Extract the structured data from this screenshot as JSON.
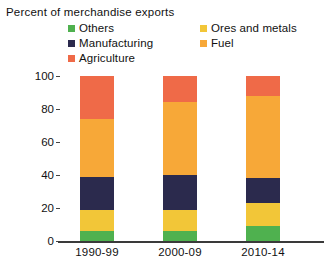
{
  "chart_data": {
    "type": "bar",
    "subtype": "stacked-bar-100",
    "title": "",
    "xlabel": "",
    "ylabel": "Percent of merchandise exports",
    "ylim": [
      0,
      100
    ],
    "yticks": [
      0,
      20,
      40,
      60,
      80,
      100
    ],
    "ytick_labels": [
      "0",
      "20",
      "40",
      "60",
      "80",
      "100"
    ],
    "grid": false,
    "legend_position": "top",
    "categories": [
      "1990-99",
      "2000-09",
      "2010-14"
    ],
    "series": [
      {
        "name": "Others",
        "color": "#4fb14f",
        "values": [
          6,
          6,
          9
        ]
      },
      {
        "name": "Ores and metals",
        "color": "#f2c638",
        "values": [
          13,
          13,
          14
        ]
      },
      {
        "name": "Manufacturing",
        "color": "#2b2a4d",
        "values": [
          20,
          21,
          15
        ]
      },
      {
        "name": "Fuel",
        "color": "#f7a838",
        "values": [
          35,
          44,
          50
        ]
      },
      {
        "name": "Agriculture",
        "color": "#ef6a48",
        "values": [
          26,
          16,
          12
        ]
      }
    ]
  },
  "axis_title": "Percent of merchandise exports",
  "legend": {
    "items": [
      {
        "label": "Others",
        "color": "#4fb14f"
      },
      {
        "label": "Ores and metals",
        "color": "#f2c638"
      },
      {
        "label": "Manufacturing",
        "color": "#2b2a4d"
      },
      {
        "label": "Fuel",
        "color": "#f7a838"
      },
      {
        "label": "Agriculture",
        "color": "#ef6a48"
      }
    ]
  },
  "yaxis": {
    "ticks": [
      "100",
      "80",
      "60",
      "40",
      "20",
      "0"
    ]
  },
  "xaxis": {
    "labels": [
      "1990-99",
      "2000-09",
      "2010-14"
    ]
  }
}
